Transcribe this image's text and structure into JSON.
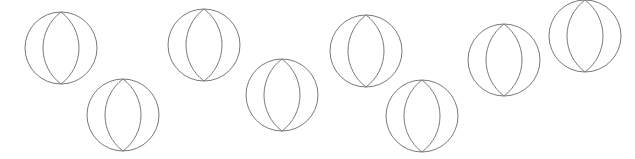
{
  "canvas": {
    "width": 635,
    "height": 159,
    "background": "#ffffff",
    "stroke_color": "#7a7a7a"
  },
  "shapes": [
    {
      "type": "ball-icon",
      "cx": 61,
      "cy": 48,
      "r": 36
    },
    {
      "type": "ball-icon",
      "cx": 123,
      "cy": 115,
      "r": 36
    },
    {
      "type": "ball-icon",
      "cx": 204,
      "cy": 45,
      "r": 36
    },
    {
      "type": "ball-icon",
      "cx": 282,
      "cy": 95,
      "r": 36
    },
    {
      "type": "ball-icon",
      "cx": 366,
      "cy": 51,
      "r": 36
    },
    {
      "type": "ball-icon",
      "cx": 422,
      "cy": 116,
      "r": 36
    },
    {
      "type": "ball-icon",
      "cx": 504,
      "cy": 60,
      "r": 36
    },
    {
      "type": "ball-icon",
      "cx": 585,
      "cy": 36,
      "r": 36
    }
  ]
}
